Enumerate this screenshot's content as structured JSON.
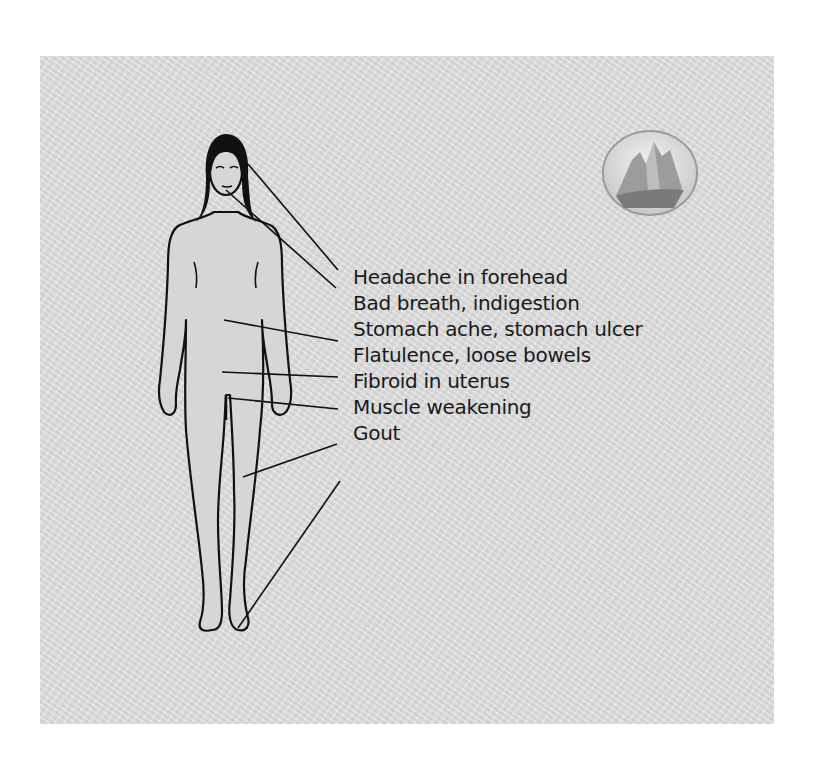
{
  "diagram": {
    "type": "body-symptom-map",
    "figure": "standing-female-outline",
    "emblem_icon": "mountain-emblem-icon",
    "labels": [
      {
        "text": "Headache in forehead",
        "points_to": "forehead"
      },
      {
        "text": "Bad breath, indigestion",
        "points_to": "mouth"
      },
      {
        "text": "Stomach ache, stomach ulcer",
        "points_to": "stomach"
      },
      {
        "text": "Flatulence, loose bowels",
        "points_to": "lower-abdomen"
      },
      {
        "text": "Fibroid in uterus",
        "points_to": "pelvis"
      },
      {
        "text": "Muscle weakening",
        "points_to": "thigh"
      },
      {
        "text": "Gout",
        "points_to": "toes"
      }
    ],
    "colors": {
      "background": "#dcdcdc",
      "line": "#111111",
      "text": "#1a1a1a"
    }
  }
}
